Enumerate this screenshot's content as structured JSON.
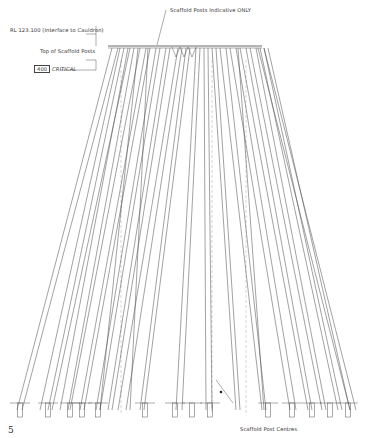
{
  "drawing": {
    "title_annotation": "Scaffold Posts Indicative ONLY",
    "level_label": "RL 123.100 (Interface to Cauldron)",
    "top_posts_label": "Top of Scaffold Posts",
    "dimension_value": "400",
    "dimension_note": "CRITICAL",
    "bottom_annotation": "Scaffold Post Centres",
    "page_number": "5"
  },
  "colors": {
    "line": "#555555",
    "background": "#ffffff"
  }
}
